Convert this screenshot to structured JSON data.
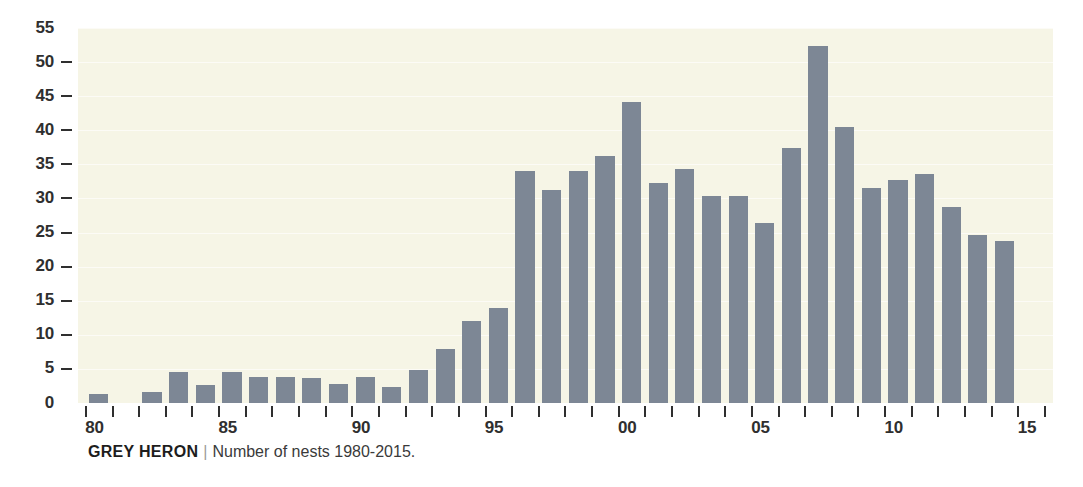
{
  "caption": {
    "species": "GREY HERON",
    "separator": "|",
    "description": "Number of nests 1980-2015."
  },
  "chart_data": {
    "type": "bar",
    "xlabel": "",
    "ylabel": "",
    "ylim": [
      0,
      55
    ],
    "ytick_values": [
      0,
      5,
      10,
      15,
      20,
      25,
      30,
      35,
      40,
      45,
      50,
      55
    ],
    "ytick_labels": [
      "0",
      "5",
      "10",
      "15",
      "20",
      "25",
      "30",
      "35",
      "40",
      "45",
      "50",
      "55"
    ],
    "grid": true,
    "legend": false,
    "bar_color": "#7d8795",
    "plot_background": "#f6f5e6",
    "xtick_labels": [
      "80",
      "85",
      "90",
      "95",
      "00",
      "05",
      "10",
      "15"
    ],
    "xtick_years": [
      1980,
      1985,
      1990,
      1995,
      2000,
      2005,
      2010,
      2015
    ],
    "categories": [
      "1980",
      "1981",
      "1982",
      "1983",
      "1984",
      "1985",
      "1986",
      "1987",
      "1988",
      "1989",
      "1990",
      "1991",
      "1992",
      "1993",
      "1994",
      "1995",
      "1996",
      "1997",
      "1998",
      "1999",
      "2000",
      "2001",
      "2002",
      "2003",
      "2004",
      "2005",
      "2006",
      "2007",
      "2008",
      "2009",
      "2010",
      "2011",
      "2012",
      "2013",
      "2014",
      "2015"
    ],
    "values": [
      1.3,
      0,
      1.6,
      4.6,
      2.6,
      4.6,
      3.8,
      3.8,
      3.7,
      2.8,
      3.8,
      2.4,
      4.8,
      7.9,
      12.1,
      14.0,
      34.0,
      31.2,
      34.0,
      36.2,
      44.2,
      32.3,
      34.3,
      30.4,
      30.4,
      26.4,
      37.4,
      52.3,
      40.5,
      31.5,
      32.7,
      33.6,
      28.7,
      24.7,
      23.7,
      0
    ]
  }
}
